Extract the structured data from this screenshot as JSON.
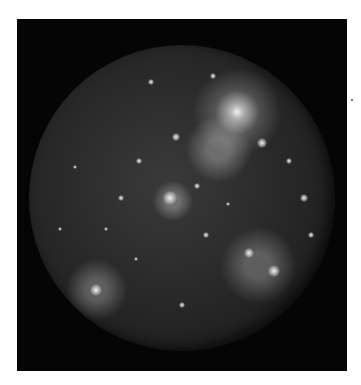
{
  "image": {
    "subject": "cratered moon (Callisto) against black background",
    "background_color": "#050505",
    "page_color": "#ffffff",
    "surface_tone": "#2a2a2a",
    "bright_spots": [
      {
        "x": 68,
        "y": 22,
        "r": 9
      },
      {
        "x": 76,
        "y": 32,
        "r": 5
      },
      {
        "x": 48,
        "y": 30,
        "r": 4
      },
      {
        "x": 46,
        "y": 50,
        "r": 7
      },
      {
        "x": 55,
        "y": 46,
        "r": 3
      },
      {
        "x": 72,
        "y": 68,
        "r": 5
      },
      {
        "x": 80,
        "y": 74,
        "r": 6
      },
      {
        "x": 22,
        "y": 80,
        "r": 6
      },
      {
        "x": 36,
        "y": 38,
        "r": 3
      },
      {
        "x": 30,
        "y": 50,
        "r": 3
      },
      {
        "x": 90,
        "y": 50,
        "r": 4
      },
      {
        "x": 60,
        "y": 10,
        "r": 3
      },
      {
        "x": 40,
        "y": 12,
        "r": 3
      },
      {
        "x": 15,
        "y": 40,
        "r": 2
      },
      {
        "x": 25,
        "y": 60,
        "r": 2
      },
      {
        "x": 58,
        "y": 62,
        "r": 3
      },
      {
        "x": 65,
        "y": 52,
        "r": 2
      },
      {
        "x": 85,
        "y": 38,
        "r": 3
      },
      {
        "x": 50,
        "y": 85,
        "r": 3
      },
      {
        "x": 35,
        "y": 70,
        "r": 2
      },
      {
        "x": 10,
        "y": 60,
        "r": 2
      },
      {
        "x": 92,
        "y": 62,
        "r": 3
      }
    ]
  }
}
